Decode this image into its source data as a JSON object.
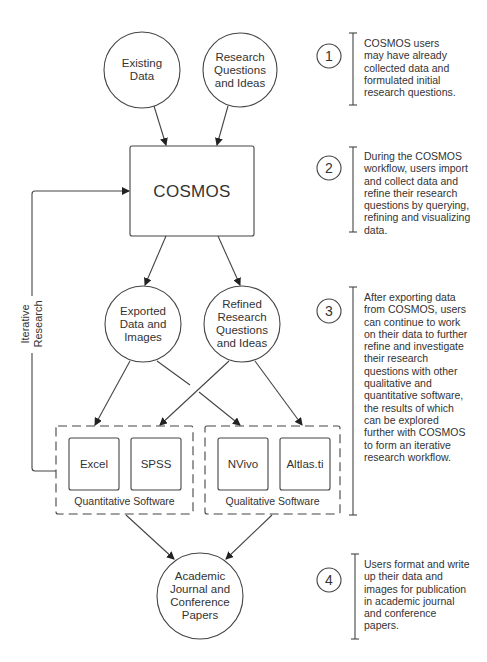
{
  "nodes": {
    "existing_data": "Existing\nData",
    "research_questions": "Research\nQuestions\nand Ideas",
    "cosmos": "COSMOS",
    "exported_data": "Exported\nData and\nImages",
    "refined_questions": "Refined\nResearch\nQuestions\nand Ideas",
    "excel": "Excel",
    "spss": "SPSS",
    "nvivo": "NVivo",
    "atlas": "Altlas.ti",
    "academic_papers": "Academic\nJournal and\nConference\nPapers"
  },
  "groups": {
    "quantitative": "Quantitative Software",
    "qualitative": "Qualitative Software"
  },
  "feedback_label": "Iterative\nResearch",
  "steps": [
    {
      "number": "1",
      "text": "COSMOS users\nmay have already\ncollected data and\nformulated initial\nresearch questions."
    },
    {
      "number": "2",
      "text": "During the COSMOS\nworkflow, users import\nand collect data and\nrefine their research\nquestions by querying,\nrefining and visualizing\ndata."
    },
    {
      "number": "3",
      "text": "After exporting data\nfrom COSMOS, users\ncan continue to work\non their data to further\nrefine and investigate\ntheir research\nquestions with other\nqualitative and\nquantitative software,\nthe results of which\ncan be explored\nfurther with COSMOS\nto form an iterative\nresearch workflow."
    },
    {
      "number": "4",
      "text": "Users format and write\nup their data and\nimages for publication\nin academic journal\nand conference\npapers."
    }
  ],
  "colors": {
    "stroke": "#333333",
    "text": "#333333",
    "background": "#ffffff"
  }
}
